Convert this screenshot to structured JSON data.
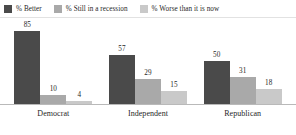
{
  "chart_data": {
    "type": "bar",
    "title": "",
    "xlabel": "",
    "ylabel": "",
    "ylim": [
      0,
      100
    ],
    "grid": false,
    "legend_position": "top-left",
    "categories": [
      "Democrat",
      "Independent",
      "Republican"
    ],
    "series": [
      {
        "name": "% Better",
        "color": "#4a4a4a",
        "values": [
          85,
          57,
          50
        ]
      },
      {
        "name": "% Still in a recession",
        "color": "#a9a9a9",
        "values": [
          10,
          29,
          31
        ]
      },
      {
        "name": "% Worse than it is now",
        "color": "#c9c9c9",
        "values": [
          4,
          15,
          18
        ]
      }
    ]
  },
  "legend": {
    "items": [
      {
        "label": "% Better",
        "color": "#4a4a4a"
      },
      {
        "label": "% Still in a recession",
        "color": "#a9a9a9"
      },
      {
        "label": "% Worse than it is now",
        "color": "#c9c9c9"
      }
    ]
  },
  "axis": {
    "tick_labels": [
      "Democrat",
      "Independent",
      "Republican"
    ]
  },
  "groups": [
    {
      "name": "Democrat",
      "bars": [
        {
          "series": "% Better",
          "value": 85,
          "label": "85",
          "color": "#4a4a4a"
        },
        {
          "series": "% Still in a recession",
          "value": 10,
          "label": "10",
          "color": "#a9a9a9"
        },
        {
          "series": "% Worse than it is now",
          "value": 4,
          "label": "4",
          "color": "#c9c9c9"
        }
      ]
    },
    {
      "name": "Independent",
      "bars": [
        {
          "series": "% Better",
          "value": 57,
          "label": "57",
          "color": "#4a4a4a"
        },
        {
          "series": "% Still in a recession",
          "value": 29,
          "label": "29",
          "color": "#a9a9a9"
        },
        {
          "series": "% Worse than it is now",
          "value": 15,
          "label": "15",
          "color": "#c9c9c9"
        }
      ]
    },
    {
      "name": "Republican",
      "bars": [
        {
          "series": "% Better",
          "value": 50,
          "label": "50",
          "color": "#4a4a4a"
        },
        {
          "series": "% Still in a recession",
          "value": 31,
          "label": "31",
          "color": "#a9a9a9"
        },
        {
          "series": "% Worse than it is now",
          "value": 18,
          "label": "18",
          "color": "#c9c9c9"
        }
      ]
    }
  ]
}
